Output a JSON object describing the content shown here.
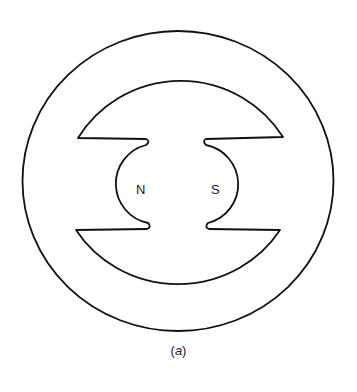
{
  "figure": {
    "caption_open": "(",
    "caption_letter": "a",
    "caption_close": ")",
    "poles": {
      "north_label": "N",
      "south_label": "S"
    },
    "stroke_color": "#111111",
    "background_color": "#ffffff"
  }
}
